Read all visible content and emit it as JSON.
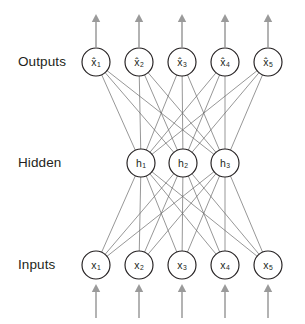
{
  "diagram": {
    "background_color": "#ffffff",
    "node_stroke_color": "#231f20",
    "edge_color": "#6a6a6a",
    "arrow_color": "#9a9a9a",
    "text_color": "#231f20",
    "layers": [
      {
        "id": "outputs",
        "label": "Outputs",
        "label_x": 18,
        "label_y": 62,
        "cy": 62,
        "radius": 14,
        "nodes": [
          {
            "id": "out-1",
            "base": "x",
            "hat": true,
            "subscript": "1",
            "cx": 96
          },
          {
            "id": "out-2",
            "base": "x",
            "hat": true,
            "subscript": "2",
            "cx": 139
          },
          {
            "id": "out-3",
            "base": "x",
            "hat": true,
            "subscript": "3",
            "cx": 182
          },
          {
            "id": "out-4",
            "base": "x",
            "hat": true,
            "subscript": "4",
            "cx": 225
          },
          {
            "id": "out-5",
            "base": "x",
            "hat": true,
            "subscript": "5",
            "cx": 268
          }
        ]
      },
      {
        "id": "hidden",
        "label": "Hidden",
        "label_x": 18,
        "label_y": 163,
        "cy": 163,
        "radius": 14,
        "nodes": [
          {
            "id": "hid-1",
            "base": "h",
            "hat": false,
            "subscript": "1",
            "cx": 141
          },
          {
            "id": "hid-2",
            "base": "h",
            "hat": false,
            "subscript": "2",
            "cx": 183
          },
          {
            "id": "hid-3",
            "base": "h",
            "hat": false,
            "subscript": "3",
            "cx": 225
          }
        ]
      },
      {
        "id": "inputs",
        "label": "Inputs",
        "label_x": 18,
        "label_y": 265,
        "cy": 265,
        "radius": 14,
        "nodes": [
          {
            "id": "in-1",
            "base": "x",
            "hat": false,
            "subscript": "1",
            "cx": 96
          },
          {
            "id": "in-2",
            "base": "x",
            "hat": false,
            "subscript": "2",
            "cx": 139
          },
          {
            "id": "in-3",
            "base": "x",
            "hat": false,
            "subscript": "3",
            "cx": 182
          },
          {
            "id": "in-4",
            "base": "x",
            "hat": false,
            "subscript": "4",
            "cx": 225
          },
          {
            "id": "in-5",
            "base": "x",
            "hat": false,
            "subscript": "5",
            "cx": 268
          }
        ]
      }
    ],
    "connections": [
      {
        "from_layer": "inputs",
        "to_layer": "hidden",
        "fully_connected": true,
        "count": 15
      },
      {
        "from_layer": "hidden",
        "to_layer": "outputs",
        "fully_connected": true,
        "count": 15
      }
    ],
    "input_arrows": {
      "count": 5,
      "direction": "up",
      "y_start": 318,
      "y_end": 284,
      "xs": [
        96,
        139,
        182,
        225,
        268
      ]
    },
    "output_arrows": {
      "count": 5,
      "direction": "up",
      "y_start": 47,
      "y_end": 14,
      "xs": [
        96,
        139,
        182,
        225,
        268
      ]
    }
  }
}
